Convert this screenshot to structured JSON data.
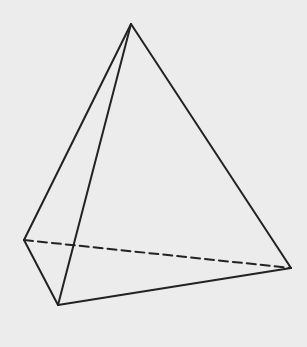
{
  "diagram": {
    "type": "tetrahedron",
    "background": "#ececec",
    "stroke_color": "#222222",
    "stroke_width": 2,
    "vertices": {
      "apex": [
        131,
        24
      ],
      "left": [
        24,
        240
      ],
      "front": [
        58,
        305
      ],
      "right": [
        291,
        268
      ]
    },
    "solid_edges": [
      [
        "apex",
        "left"
      ],
      [
        "apex",
        "front"
      ],
      [
        "apex",
        "right"
      ],
      [
        "left",
        "front"
      ],
      [
        "front",
        "right"
      ]
    ],
    "dashed_edges": [
      [
        "left",
        "right"
      ]
    ],
    "dash_pattern": "9,5"
  }
}
